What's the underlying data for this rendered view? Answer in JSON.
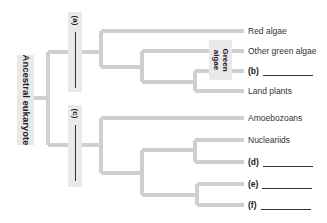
{
  "diagram": {
    "type": "phylogenetic-tree",
    "root_label": "Ancestral eukaryote",
    "branch_color": "#cfcfcf",
    "label_box_color": "#e9e9e9",
    "clade_labels": [
      {
        "id": "a",
        "tag": "(a)",
        "blank": true
      },
      {
        "id": "c",
        "tag": "(c)",
        "blank": true
      }
    ],
    "group_label": "Green algae",
    "group_label_lines": [
      "Green",
      "algae"
    ],
    "leaves": [
      {
        "id": "red-algae",
        "text": "Red algae",
        "blank": false
      },
      {
        "id": "other-green-algae",
        "text": "Other green algae",
        "blank": false
      },
      {
        "id": "b",
        "text": "(b)",
        "blank": true
      },
      {
        "id": "land-plants",
        "text": "Land plants",
        "blank": false
      },
      {
        "id": "amoebozoans",
        "text": "Amoebozoans",
        "blank": false
      },
      {
        "id": "nucleariids",
        "text": "Nucleariids",
        "blank": false
      },
      {
        "id": "d",
        "text": "(d)",
        "blank": true
      },
      {
        "id": "e",
        "text": "(e)",
        "blank": true
      },
      {
        "id": "f",
        "text": "(f)",
        "blank": true
      }
    ]
  }
}
